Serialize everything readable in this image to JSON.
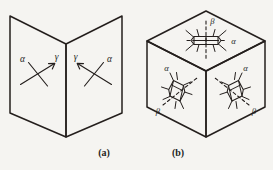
{
  "figure": {
    "background_color": "#f5f4f1",
    "ink_color": "#241f1d",
    "width": 273,
    "height": 170
  },
  "panels": [
    {
      "id": "a",
      "caption": "(a)",
      "description": "open-book pair of planes with crossed direction markers",
      "markers": [
        {
          "id": "left-cross",
          "labels": [
            {
              "name": "alpha",
              "glyph": "α",
              "position": "upper-left"
            },
            {
              "name": "gamma",
              "glyph": "γ",
              "position": "upper-right"
            }
          ]
        },
        {
          "id": "right-cross",
          "labels": [
            {
              "name": "gamma",
              "glyph": "γ",
              "position": "upper-left"
            },
            {
              "name": "alpha",
              "glyph": "α",
              "position": "upper-right"
            }
          ]
        }
      ]
    },
    {
      "id": "b",
      "caption": "(b)",
      "description": "isometric cube with molecular ring motifs on three visible faces",
      "faces": [
        {
          "id": "top-face",
          "labels": [
            {
              "name": "beta",
              "glyph": "β",
              "position": "above"
            },
            {
              "name": "alpha",
              "glyph": "α",
              "position": "right"
            }
          ]
        },
        {
          "id": "left-face",
          "labels": [
            {
              "name": "alpha",
              "glyph": "α",
              "position": "upper-right"
            },
            {
              "name": "beta",
              "glyph": "β",
              "position": "lower-left"
            }
          ]
        },
        {
          "id": "right-face",
          "labels": [
            {
              "name": "alpha",
              "glyph": "α",
              "position": "upper-right"
            },
            {
              "name": "beta",
              "glyph": "β",
              "position": "lower-right"
            }
          ]
        }
      ]
    }
  ],
  "captions": {
    "panel_a": "(a)",
    "panel_b": "(b)"
  },
  "labels": {
    "alpha": "α",
    "beta": "β",
    "gamma": "γ"
  }
}
